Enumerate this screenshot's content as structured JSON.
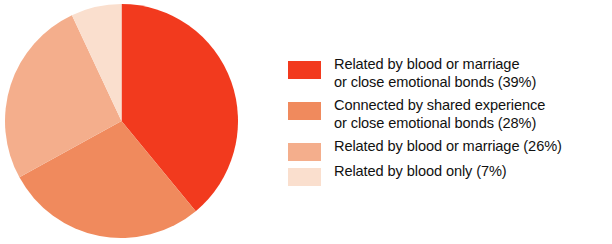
{
  "chart_data": {
    "type": "pie",
    "title": "",
    "categories": [
      "Related by blood or marriage or close emotional bonds",
      "Connected by shared experience or close emotional bonds",
      "Related by blood or marriage",
      "Related by blood only"
    ],
    "values": [
      39,
      28,
      26,
      7
    ],
    "value_unit": "percent",
    "start_angle_deg": 0,
    "direction": "clockwise",
    "legend_position": "right",
    "grid": false,
    "colors": [
      "#F23A1E",
      "#F08A5D",
      "#F4AE8C",
      "#FADFCE"
    ],
    "slices": [
      {
        "label": "Related by blood or marriage or close emotional bonds",
        "value": 39,
        "color": "#F23A1E"
      },
      {
        "label": "Connected by shared experience or close emotional bonds",
        "value": 28,
        "color": "#F08A5D"
      },
      {
        "label": "Related by blood or marriage",
        "value": 26,
        "color": "#F4AE8C"
      },
      {
        "label": "Related by blood only",
        "value": 7,
        "color": "#FADFCE"
      }
    ]
  },
  "legend": {
    "entries": [
      {
        "text": "Related by blood or marriage\nor close emotional bonds (39%)",
        "color": "#F23A1E"
      },
      {
        "text": "Connected by shared experience\nor close emotional bonds (28%)",
        "color": "#F08A5D"
      },
      {
        "text": "Related by blood or marriage (26%)",
        "color": "#F4AE8C"
      },
      {
        "text": "Related by blood only (7%)",
        "color": "#FADFCE"
      }
    ]
  }
}
